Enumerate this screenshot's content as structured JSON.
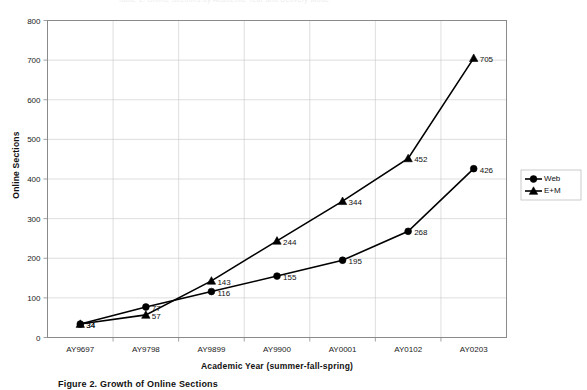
{
  "chart_data": {
    "type": "line",
    "title": "",
    "xlabel": "Academic Year (summer-fall-spring)",
    "ylabel": "Online Sections",
    "categories": [
      "AY9697",
      "AY9798",
      "AY9899",
      "AY9900",
      "AY0001",
      "AY0102",
      "AY0203"
    ],
    "series": [
      {
        "name": "Web",
        "marker": "circle",
        "values": [
          34,
          77,
          116,
          155,
          195,
          268,
          426
        ],
        "labels": [
          "34",
          "77",
          "116",
          "155",
          "195",
          "268",
          "426"
        ]
      },
      {
        "name": "E+M",
        "marker": "triangle",
        "values": [
          34,
          57,
          143,
          244,
          344,
          452,
          705
        ],
        "labels": [
          "34",
          "57",
          "143",
          "244",
          "344",
          "452",
          "705"
        ]
      }
    ],
    "ylim": [
      0,
      800
    ],
    "ytick_values": [
      0,
      100,
      200,
      300,
      400,
      500,
      600,
      700,
      800
    ],
    "ytick_labels": [
      "0",
      "100",
      "200",
      "300",
      "400",
      "500",
      "600",
      "700",
      "800"
    ],
    "grid": "horizontal-and-vertical",
    "legend_position": "right",
    "line_color": "#000000",
    "grid_color": "#c8c8c8",
    "frame_color": "#8a8a8a"
  },
  "legend": {
    "entries": [
      {
        "label": "Web",
        "marker": "circle-marker"
      },
      {
        "label": "E+M",
        "marker": "triangle-marker"
      }
    ]
  },
  "caption": {
    "text": "Figure 2. Growth of Online Sections"
  },
  "artifacts": {
    "top_line": "Table 1. Online Sections by Academic Year and Delivery Mode"
  }
}
